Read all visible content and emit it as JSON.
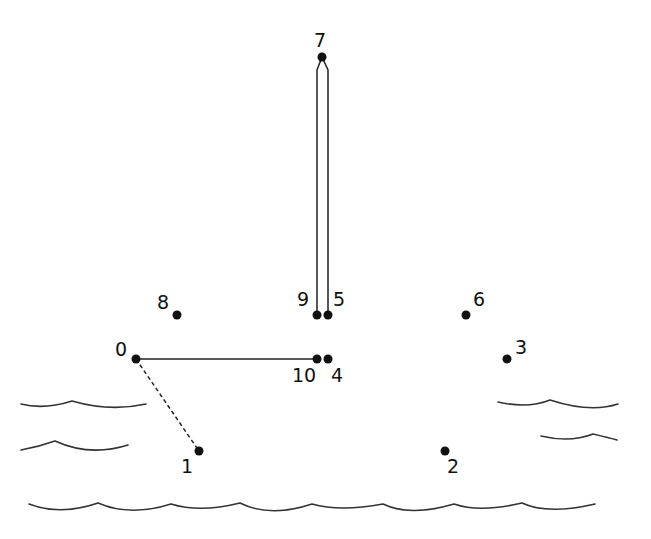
{
  "puzzle": {
    "type": "connect-the-dots",
    "theme": "sailboat on water",
    "colors": {
      "background": "#ffffff",
      "ink": "#111111",
      "wave": "#333333"
    },
    "dots": [
      {
        "n": 0,
        "label": "0",
        "x": 136,
        "y": 359,
        "lx": 115,
        "ly": 356
      },
      {
        "n": 1,
        "label": "1",
        "x": 199,
        "y": 451,
        "lx": 181,
        "ly": 473
      },
      {
        "n": 2,
        "label": "2",
        "x": 445,
        "y": 451,
        "lx": 447,
        "ly": 473
      },
      {
        "n": 3,
        "label": "3",
        "x": 507,
        "y": 359,
        "lx": 515,
        "ly": 354
      },
      {
        "n": 4,
        "label": "4",
        "x": 328,
        "y": 359,
        "lx": 331,
        "ly": 382
      },
      {
        "n": 5,
        "label": "5",
        "x": 328,
        "y": 315,
        "lx": 333,
        "ly": 306
      },
      {
        "n": 6,
        "label": "6",
        "x": 466,
        "y": 315,
        "lx": 473,
        "ly": 306
      },
      {
        "n": 7,
        "label": "7",
        "x": 322,
        "y": 57,
        "lx": 314,
        "ly": 47
      },
      {
        "n": 8,
        "label": "8",
        "x": 177,
        "y": 315,
        "lx": 157,
        "ly": 309
      },
      {
        "n": 9,
        "label": "9",
        "x": 317,
        "y": 315,
        "lx": 297,
        "ly": 306
      },
      {
        "n": 10,
        "label": "10",
        "x": 317,
        "y": 359,
        "lx": 292,
        "ly": 382
      }
    ],
    "connections": {
      "solid": [
        {
          "from": 0,
          "to": 10
        },
        {
          "from": 7,
          "to": 9
        },
        {
          "from": 7,
          "to": 5
        }
      ],
      "dashed": [
        {
          "from": 0,
          "to": 1
        }
      ]
    },
    "waves": [
      {
        "id": "left-upper",
        "d": "M21,404 Q44,410 72,401 Q110,412 146,404"
      },
      {
        "id": "left-lower",
        "d": "M21,450 Q38,447 55,441 Q90,457 128,445"
      },
      {
        "id": "right-upper",
        "d": "M498,402 Q528,409 550,400 Q590,413 618,404"
      },
      {
        "id": "right-lower",
        "d": "M541,436 Q570,443 593,434 Q610,438 617,440"
      },
      {
        "id": "bottom",
        "d": "M29,504 Q60,516 98,503 Q130,517 171,504 Q200,513 240,503 Q270,518 312,504 Q340,512 383,504 Q410,517 454,504 Q480,513 522,503 Q548,515 595,504"
      }
    ]
  }
}
